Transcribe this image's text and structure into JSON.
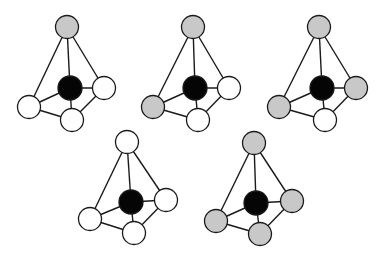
{
  "diagram": {
    "colors": {
      "central": "#050505",
      "white": "#ffffff",
      "gray": "#c8c8c8",
      "stroke": "#1a1a1a"
    },
    "molecules": [
      {
        "id": "molecule-1",
        "center": {
          "x": 70,
          "y": 88,
          "fill": "central"
        },
        "top": {
          "x": 67,
          "y": 27,
          "fill": "gray"
        },
        "right": {
          "x": 104,
          "y": 88,
          "fill": "white"
        },
        "left": {
          "x": 29,
          "y": 107,
          "fill": "white"
        },
        "bottom": {
          "x": 72,
          "y": 120,
          "fill": "white"
        }
      },
      {
        "id": "molecule-2",
        "center": {
          "x": 195,
          "y": 88,
          "fill": "central"
        },
        "top": {
          "x": 193,
          "y": 27,
          "fill": "gray"
        },
        "right": {
          "x": 229,
          "y": 88,
          "fill": "white"
        },
        "left": {
          "x": 153,
          "y": 107,
          "fill": "gray"
        },
        "bottom": {
          "x": 198,
          "y": 120,
          "fill": "white"
        }
      },
      {
        "id": "molecule-3",
        "center": {
          "x": 322,
          "y": 88,
          "fill": "central"
        },
        "top": {
          "x": 319,
          "y": 27,
          "fill": "gray"
        },
        "right": {
          "x": 356,
          "y": 88,
          "fill": "gray"
        },
        "left": {
          "x": 279,
          "y": 107,
          "fill": "gray"
        },
        "bottom": {
          "x": 325,
          "y": 120,
          "fill": "white"
        }
      },
      {
        "id": "molecule-4",
        "center": {
          "x": 131,
          "y": 202,
          "fill": "central"
        },
        "top": {
          "x": 127,
          "y": 142,
          "fill": "white"
        },
        "right": {
          "x": 166,
          "y": 200,
          "fill": "white"
        },
        "left": {
          "x": 90,
          "y": 219,
          "fill": "white"
        },
        "bottom": {
          "x": 134,
          "y": 233,
          "fill": "white"
        }
      },
      {
        "id": "molecule-5",
        "center": {
          "x": 256,
          "y": 203,
          "fill": "central"
        },
        "top": {
          "x": 254,
          "y": 143,
          "fill": "gray"
        },
        "right": {
          "x": 292,
          "y": 201,
          "fill": "gray"
        },
        "left": {
          "x": 216,
          "y": 221,
          "fill": "gray"
        },
        "bottom": {
          "x": 260,
          "y": 234,
          "fill": "gray"
        }
      }
    ],
    "atom_radius": 11.5,
    "center_radius": 12
  }
}
